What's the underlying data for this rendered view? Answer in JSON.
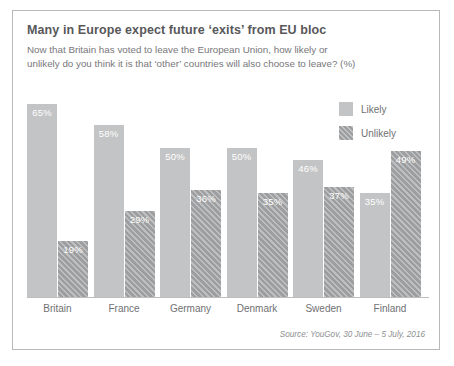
{
  "title": "Many in Europe expect future ‘exits’ from EU bloc",
  "subtitle": "Now that Britain has voted to leave the European Union, how likely or unlikely do you think it is that ‘other’ countries will also choose to leave? (%)",
  "source": "Source: YouGov, 30 June – 5 July, 2016",
  "legend": {
    "likely_label": "Likely",
    "unlikely_label": "Unlikely"
  },
  "colors": {
    "likely": "#c3c4c5",
    "unlikely": "#9d9ea0",
    "title_text": "#58585a",
    "body_text": "#77777a",
    "frame_border": "#b9b9b9",
    "value_label": "#ffffff"
  },
  "chart_data": {
    "type": "bar",
    "title": "Many in Europe expect future ‘exits’ from EU bloc",
    "subtitle": "Now that Britain has voted to leave the European Union, how likely or unlikely do you think it is that ‘other’ countries will also choose to leave? (%)",
    "xlabel": "",
    "ylabel": "",
    "ylim": [
      0,
      70
    ],
    "grid": false,
    "legend_position": "top-right",
    "categories": [
      "Britain",
      "France",
      "Germany",
      "Denmark",
      "Sweden",
      "Finland"
    ],
    "series": [
      {
        "name": "Likely",
        "values": [
          65,
          58,
          50,
          50,
          46,
          35
        ]
      },
      {
        "name": "Unlikely",
        "values": [
          19,
          29,
          36,
          35,
          37,
          49
        ]
      }
    ],
    "value_labels": {
      "Likely": [
        "65%",
        "58%",
        "50%",
        "50%",
        "46%",
        "35%"
      ],
      "Unlikely": [
        "19%",
        "29%",
        "36%",
        "35%",
        "37%",
        "49%"
      ]
    }
  }
}
